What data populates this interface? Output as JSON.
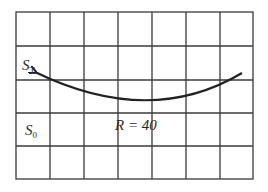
{
  "diagram": {
    "grid": {
      "columns": 7,
      "rows": 5,
      "line_color": "#3a3a3a",
      "x_lines": [
        16,
        50,
        84,
        118,
        152,
        186,
        220,
        253
      ],
      "y_lines": [
        12,
        46,
        80,
        113,
        146,
        179
      ]
    },
    "labels": {
      "s_t": {
        "main": "S",
        "sub": "T"
      },
      "s_0": {
        "main": "S",
        "sub": "0"
      },
      "radius": "R = 40"
    },
    "curve": {
      "description": "curved arrow from right to left, concave up",
      "start": [
        242,
        73
      ],
      "end": [
        34,
        71
      ],
      "lowest_point": [
        150,
        101
      ],
      "color": "#222222",
      "arrow_at": "end"
    }
  }
}
